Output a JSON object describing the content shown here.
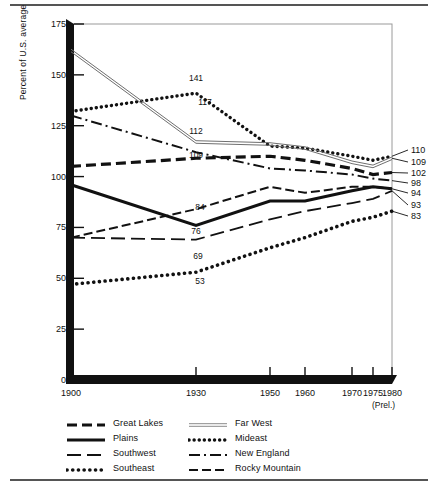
{
  "chart_data": {
    "type": "line",
    "title": "",
    "xlabel": "",
    "ylabel": "Percent of U.S. average",
    "xlim": [
      1900,
      1980
    ],
    "ylim": [
      0,
      175
    ],
    "grid": false,
    "legend_position": "below",
    "x": [
      1900,
      1930,
      1950,
      1960,
      1970,
      1975,
      1980
    ],
    "xtick_labels": [
      "1900",
      "1930",
      "1950",
      "1960",
      "1970",
      "1975",
      "1980"
    ],
    "xtick_note": "(Prel.)",
    "ytick_labels": [
      "0",
      "25",
      "50",
      "75",
      "100",
      "125",
      "150",
      "175"
    ],
    "ytick_values": [
      0,
      25,
      50,
      75,
      100,
      125,
      150,
      175
    ],
    "series": [
      {
        "name": "Mideast",
        "style": "dotted-heavy",
        "values": [
          132,
          141,
          115,
          114,
          110,
          108,
          110
        ]
      },
      {
        "name": "Far West",
        "style": "thin-double",
        "values": [
          162,
          117,
          116,
          114,
          107,
          105,
          109
        ]
      },
      {
        "name": "Great Lakes",
        "style": "dashed-heavy",
        "values": [
          105,
          109,
          110,
          108,
          104,
          101,
          102
        ]
      },
      {
        "name": "New England",
        "style": "dash-dot",
        "values": [
          130,
          112,
          104,
          103,
          101,
          99,
          98
        ]
      },
      {
        "name": "Rocky Mountain",
        "style": "dashed-medium",
        "values": [
          70,
          84,
          95,
          92,
          95,
          95,
          94
        ]
      },
      {
        "name": "Plains",
        "style": "solid-heavy",
        "values": [
          96,
          76,
          88,
          88,
          93,
          95,
          94
        ]
      },
      {
        "name": "Southwest",
        "style": "long-dash",
        "values": [
          70,
          69,
          79,
          83,
          87,
          89,
          93
        ]
      },
      {
        "name": "Southeast",
        "style": "dotted-round",
        "values": [
          47,
          53,
          65,
          70,
          78,
          80,
          83
        ]
      }
    ],
    "point_labels_1930": [
      {
        "text": "141",
        "series": "Mideast"
      },
      {
        "text": "117",
        "series": "Far West"
      },
      {
        "text": "112",
        "series": "New England"
      },
      {
        "text": "109",
        "series": "Great Lakes"
      },
      {
        "text": "84",
        "series": "Rocky Mountain"
      },
      {
        "text": "76",
        "series": "Plains"
      },
      {
        "text": "69",
        "series": "Southwest"
      },
      {
        "text": "53",
        "series": "Southeast"
      }
    ],
    "end_labels_1980": [
      {
        "text": "110",
        "series": "Mideast"
      },
      {
        "text": "109",
        "series": "Far West"
      },
      {
        "text": "102",
        "series": "Great Lakes"
      },
      {
        "text": "98",
        "series": "New England"
      },
      {
        "text": "94",
        "series": "Rocky Mountain"
      },
      {
        "text": "93",
        "series": "Southwest"
      },
      {
        "text": "83",
        "series": "Southeast"
      }
    ],
    "legend": {
      "left_column": [
        {
          "label": "Great Lakes",
          "style": "dashed-heavy"
        },
        {
          "label": "Plains",
          "style": "solid-heavy"
        },
        {
          "label": "Southwest",
          "style": "long-dash"
        },
        {
          "label": "Southeast",
          "style": "dotted-round"
        }
      ],
      "right_column": [
        {
          "label": "Far West",
          "style": "thin-double"
        },
        {
          "label": "Mideast",
          "style": "dotted-heavy"
        },
        {
          "label": "New England",
          "style": "dash-dot"
        },
        {
          "label": "Rocky Mountain",
          "style": "dashed-medium"
        }
      ]
    }
  }
}
